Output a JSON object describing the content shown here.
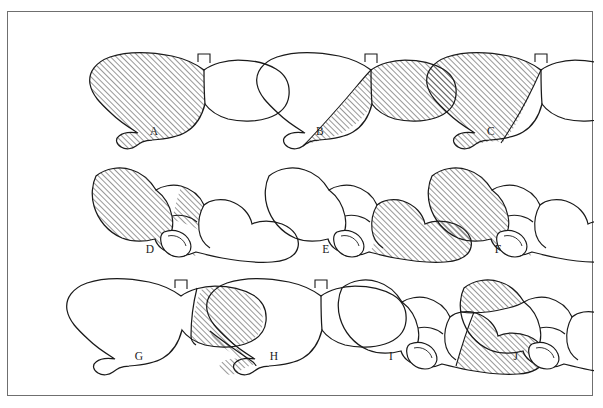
{
  "figure": {
    "frame": {
      "x": 7,
      "y": 11,
      "width": 586,
      "height": 385,
      "border_color": "#6f6f6f"
    },
    "background_color": "#ffffff",
    "ink_color": "#1a1a1a",
    "hatch_description": "45-degree diagonal line shading",
    "view_types": {
      "anterior": "anterior (diaphragmatic) view of liver",
      "visceral": "visceral (inferior / posterior) view of liver"
    }
  },
  "panels": [
    {
      "id": "A",
      "label": "A",
      "view": "anterior",
      "row": 1,
      "column": 1,
      "label_x": 131,
      "label_y": 124,
      "origin_x": 78,
      "origin_y": 38,
      "shaded_region": "entire right lobe",
      "shaded_side": "left-of-figure (right hepatic lobe)"
    },
    {
      "id": "B",
      "label": "B",
      "view": "anterior",
      "row": 1,
      "column": 2,
      "label_x": 297,
      "label_y": 124,
      "origin_x": 245,
      "origin_y": 38,
      "shaded_region": "left lobe plus medial segment",
      "shaded_side": "right-of-figure (left hepatic lobe)"
    },
    {
      "id": "C",
      "label": "C",
      "view": "anterior",
      "row": 1,
      "column": 3,
      "label_x": 468,
      "label_y": 124,
      "origin_x": 415,
      "origin_y": 38,
      "shaded_region": "lateral portion of right lobe",
      "shaded_side": "left-of-figure (right lateral)"
    },
    {
      "id": "D",
      "label": "D",
      "view": "visceral",
      "row": 2,
      "column": 1,
      "label_x": 127,
      "label_y": 242,
      "origin_x": 72,
      "origin_y": 152,
      "shaded_region": "right lobe and caudate area",
      "shaded_side": "left-of-figure"
    },
    {
      "id": "E",
      "label": "E",
      "view": "visceral",
      "row": 2,
      "column": 2,
      "label_x": 303,
      "label_y": 242,
      "origin_x": 245,
      "origin_y": 152,
      "shaded_region": "left lobe and medial segment",
      "shaded_side": "right-of-figure"
    },
    {
      "id": "F",
      "label": "F",
      "view": "visceral",
      "row": 2,
      "column": 3,
      "label_x": 475,
      "label_y": 242,
      "origin_x": 408,
      "origin_y": 152,
      "shaded_region": "right lateral lobe",
      "shaded_side": "left-of-figure"
    },
    {
      "id": "G",
      "label": "G",
      "view": "anterior",
      "row": 3,
      "column": 1,
      "label_x": 116,
      "label_y": 349,
      "origin_x": 55,
      "origin_y": 264,
      "shaded_region": "left lateral segment",
      "shaded_side": "right-of-figure (left lateral)"
    },
    {
      "id": "H",
      "label": "H",
      "view": "anterior",
      "row": 3,
      "column": 2,
      "label_x": 251,
      "label_y": 349,
      "origin_x": 195,
      "origin_y": 264,
      "shaded_region": "inferior-lateral wedge of right lobe",
      "shaded_side": "left-of-figure lower edge"
    },
    {
      "id": "I",
      "label": "I",
      "view": "visceral",
      "row": 3,
      "column": 3,
      "label_x": 368,
      "label_y": 349,
      "origin_x": 318,
      "origin_y": 264,
      "shaded_region": "left lateral segment",
      "shaded_side": "right-of-figure"
    },
    {
      "id": "J",
      "label": "J",
      "view": "visceral",
      "row": 3,
      "column": 4,
      "label_x": 493,
      "label_y": 349,
      "origin_x": 440,
      "origin_y": 264,
      "shaded_region": "superior wedge of right lobe",
      "shaded_side": "upper-left corner"
    }
  ]
}
